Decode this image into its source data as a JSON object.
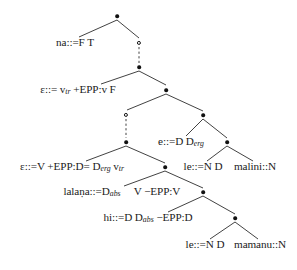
{
  "figure": {
    "kind": "minimalist-grammar-derivation-tree",
    "width": 297,
    "height": 270,
    "background_color": "#ffffff",
    "ink_color": "#111111"
  },
  "nodes": [
    {
      "id": "n0",
      "type": "dot",
      "label": "•",
      "x": 117,
      "y": 16
    },
    {
      "id": "n1",
      "type": "label",
      "label": "na::=F T",
      "x": 75,
      "y": 43
    },
    {
      "id": "n2",
      "type": "circle",
      "label": "○",
      "x": 139,
      "y": 43
    },
    {
      "id": "n3",
      "type": "dot",
      "label": "•",
      "x": 139,
      "y": 67
    },
    {
      "id": "n4",
      "type": "label",
      "label": "ε::= v",
      "sub": "tr",
      "label2": " +EPP:v F",
      "x": 78,
      "y": 90
    },
    {
      "id": "n5",
      "type": "dot",
      "label": "•",
      "x": 166,
      "y": 90
    },
    {
      "id": "n6",
      "type": "circle",
      "label": "○",
      "x": 126,
      "y": 115
    },
    {
      "id": "n7",
      "type": "dot",
      "label": "•",
      "x": 203,
      "y": 115
    },
    {
      "id": "n8",
      "type": "dot",
      "label": "•",
      "x": 126,
      "y": 142
    },
    {
      "id": "n9",
      "type": "label",
      "label": "e::=D D",
      "sub": "erg",
      "label2": "",
      "x": 181,
      "y": 142
    },
    {
      "id": "n10",
      "type": "dot",
      "label": "•",
      "x": 227,
      "y": 142
    },
    {
      "id": "n11",
      "type": "label",
      "label": "ε::=V +EPP:D= D",
      "sub": "erg",
      "label2": " v",
      "sub2": "tr",
      "x": 72,
      "y": 167
    },
    {
      "id": "n12",
      "type": "dot",
      "label": "•",
      "x": 165,
      "y": 167
    },
    {
      "id": "n13",
      "type": "label",
      "label": "le::=N D",
      "x": 203,
      "y": 167
    },
    {
      "id": "n14",
      "type": "label",
      "label": "malini::N",
      "x": 255,
      "y": 167
    },
    {
      "id": "n15",
      "type": "label",
      "label": "lalaṇa::=D",
      "sub": "abs",
      "label2": "",
      "x": 92,
      "y": 192
    },
    {
      "id": "n16",
      "type": "label",
      "label": "V −EPP:V",
      "x": 157,
      "y": 192
    },
    {
      "id": "n17",
      "type": "dot",
      "label": "•",
      "x": 203,
      "y": 192
    },
    {
      "id": "n18",
      "type": "label",
      "label": "hi::=D D",
      "sub": "abs",
      "label2": " −EPP:D",
      "x": 148,
      "y": 218
    },
    {
      "id": "n19",
      "type": "dot",
      "label": "•",
      "x": 235,
      "y": 218
    },
    {
      "id": "n20",
      "type": "label",
      "label": "le::=N D",
      "x": 205,
      "y": 245
    },
    {
      "id": "n21",
      "type": "label",
      "label": "mamanu::N",
      "x": 260,
      "y": 245
    }
  ],
  "edges": [
    {
      "from": "n0",
      "to": "n1",
      "x1": 117,
      "y1": 20,
      "x2": 79,
      "y2": 37
    },
    {
      "from": "n0",
      "to": "n2",
      "x1": 117,
      "y1": 20,
      "x2": 139,
      "y2": 38
    },
    {
      "from": "n2",
      "to": "n3",
      "x1": 139,
      "y1": 47,
      "x2": 139,
      "y2": 63,
      "style": "dashed"
    },
    {
      "from": "n3",
      "to": "n4",
      "x1": 139,
      "y1": 71,
      "x2": 101,
      "y2": 84
    },
    {
      "from": "n3",
      "to": "n5",
      "x1": 139,
      "y1": 71,
      "x2": 166,
      "y2": 85
    },
    {
      "from": "n5",
      "to": "n6",
      "x1": 166,
      "y1": 94,
      "x2": 127,
      "y2": 110
    },
    {
      "from": "n5",
      "to": "n7",
      "x1": 166,
      "y1": 94,
      "x2": 203,
      "y2": 111
    },
    {
      "from": "n6",
      "to": "n8",
      "x1": 126,
      "y1": 119,
      "x2": 126,
      "y2": 138,
      "style": "dashed"
    },
    {
      "from": "n7",
      "to": "n9",
      "x1": 203,
      "y1": 119,
      "x2": 186,
      "y2": 136
    },
    {
      "from": "n7",
      "to": "n10",
      "x1": 203,
      "y1": 119,
      "x2": 227,
      "y2": 138
    },
    {
      "from": "n8",
      "to": "n11",
      "x1": 126,
      "y1": 146,
      "x2": 86,
      "y2": 161
    },
    {
      "from": "n8",
      "to": "n12",
      "x1": 126,
      "y1": 146,
      "x2": 165,
      "y2": 163
    },
    {
      "from": "n10",
      "to": "n13",
      "x1": 227,
      "y1": 146,
      "x2": 207,
      "y2": 161
    },
    {
      "from": "n10",
      "to": "n14",
      "x1": 227,
      "y1": 146,
      "x2": 253,
      "y2": 161
    },
    {
      "from": "n12",
      "to": "n15",
      "x1": 165,
      "y1": 171,
      "x2": 124,
      "y2": 186
    },
    {
      "from": "n12",
      "to": "n17",
      "x1": 165,
      "y1": 171,
      "x2": 203,
      "y2": 188
    },
    {
      "from": "n17",
      "to": "n18",
      "x1": 203,
      "y1": 196,
      "x2": 168,
      "y2": 212
    },
    {
      "from": "n17",
      "to": "n19",
      "x1": 203,
      "y1": 196,
      "x2": 235,
      "y2": 214
    },
    {
      "from": "n19",
      "to": "n20",
      "x1": 235,
      "y1": 222,
      "x2": 210,
      "y2": 239
    },
    {
      "from": "n19",
      "to": "n21",
      "x1": 235,
      "y1": 222,
      "x2": 258,
      "y2": 239
    }
  ],
  "text_items": {
    "n1": "na::=F T",
    "n4": "ε::= v_tr +EPP:v F",
    "n9": "e::=D D_erg",
    "n11": "ε::=V +EPP:D= D_erg v_tr",
    "n13": "le::=N D",
    "n14": "malini::N",
    "n15": "lalaṇa::=D_abs",
    "n16": "V −EPP:V",
    "n18": "hi::=D D_abs −EPP:D",
    "n20": "le::=N D",
    "n21": "mamanu::N"
  }
}
